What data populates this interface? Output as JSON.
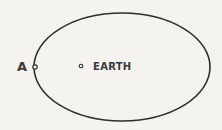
{
  "diagram": {
    "type": "orbit",
    "orbit": {
      "shape": "ellipse",
      "cx": 122,
      "cy": 67,
      "rx": 88,
      "ry": 55
    },
    "points": [
      {
        "id": "A",
        "label": "A",
        "x": 35,
        "y": 67
      },
      {
        "id": "earth",
        "label": "EARTH",
        "x": 81,
        "y": 66
      }
    ],
    "colors": {
      "line": "#2e2e2e",
      "background": "#f4f3ef"
    }
  }
}
